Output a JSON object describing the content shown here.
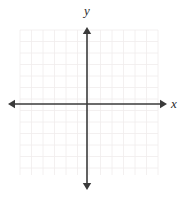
{
  "figure": {
    "width": 184,
    "height": 197,
    "background_color": "#ffffff"
  },
  "axes": {
    "x_label": "x",
    "y_label": "y",
    "axis_color": "#3a3a3a",
    "axis_line_width": 1.6,
    "arrowheads": [
      "left",
      "right",
      "up",
      "down"
    ],
    "origin_x_px": 87,
    "origin_y_px": 104
  },
  "grid": {
    "color": "#f0ecec",
    "line_width": 0.8,
    "cell_size_px": 11.5,
    "left_px": 20,
    "right_px": 158,
    "top_px": 30,
    "bottom_px": 175,
    "columns": 12,
    "rows": 13,
    "visible": true
  },
  "chart_data": {
    "type": "scatter",
    "title": "",
    "subtitle": "",
    "xlabel": "x",
    "ylabel": "y",
    "series": [
      {
        "name": "empty",
        "x": [],
        "y": []
      }
    ],
    "x": [],
    "values": [],
    "categories": [],
    "xlim": [
      -6,
      6
    ],
    "ylim": [
      -6,
      7
    ],
    "xticks": [],
    "yticks": [],
    "xticklabels": [],
    "yticklabels": [],
    "grid": true,
    "legend": false,
    "legend_position": "none",
    "annotations": [],
    "note": "Blank coordinate plane: axes drawn with arrowheads on both ends, light grid squares, no plotted data and no numeric tick labels."
  }
}
